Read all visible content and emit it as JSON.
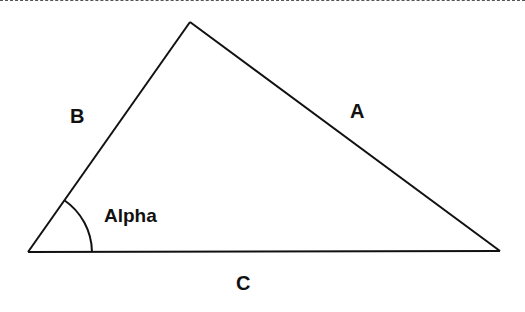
{
  "diagram": {
    "type": "triangle",
    "stroke_color": "#111111",
    "background_color": "#ffffff",
    "vertices": {
      "top": [
        190,
        22
      ],
      "bottom_left": [
        28,
        252
      ],
      "bottom_right": [
        500,
        251
      ]
    },
    "sides": {
      "a": {
        "label": "A"
      },
      "b": {
        "label": "B"
      },
      "c": {
        "label": "C"
      }
    },
    "angle": {
      "label": "Alpha",
      "vertex": "bottom_left"
    }
  }
}
